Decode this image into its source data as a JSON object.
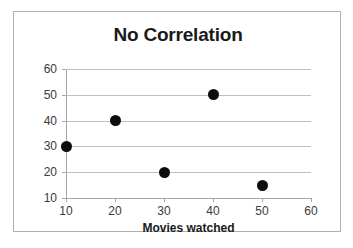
{
  "chart_data": {
    "type": "scatter",
    "title": "No Correlation",
    "xlabel": "Movies watched",
    "ylabel": "Test Score",
    "x": [
      10,
      20,
      30,
      40,
      50
    ],
    "values": [
      30,
      40,
      20,
      50,
      15
    ],
    "points": [
      {
        "x": 10,
        "y": 30
      },
      {
        "x": 20,
        "y": 40
      },
      {
        "x": 30,
        "y": 20
      },
      {
        "x": 40,
        "y": 50
      },
      {
        "x": 50,
        "y": 15
      }
    ],
    "xlim": [
      10,
      60
    ],
    "ylim": [
      10,
      60
    ],
    "xticks": [
      "10",
      "20",
      "30",
      "40",
      "50",
      "60"
    ],
    "yticks": [
      "10",
      "20",
      "30",
      "40",
      "50",
      "60"
    ],
    "grid": "horizontal",
    "legend": null,
    "marker_color": "#0d0d0d",
    "gridline_color": "#bfbfbf",
    "axis_color": "#a6a6a6",
    "border_color": "#b0b0b0",
    "background_color": "#ffffff"
  }
}
